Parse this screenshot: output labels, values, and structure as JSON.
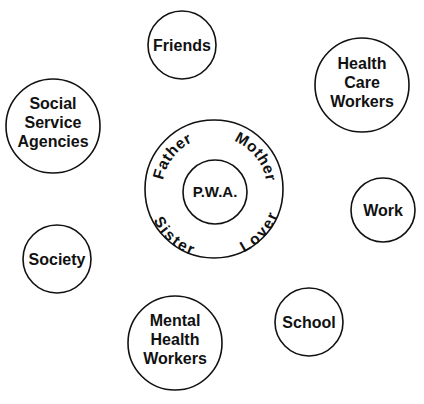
{
  "diagram": {
    "center": {
      "label": "P.W.A.",
      "ring": [
        "Father",
        "Mother",
        "Sister",
        "Lover"
      ]
    },
    "nodes": [
      {
        "id": "friends",
        "lines": [
          "Friends"
        ]
      },
      {
        "id": "health-care-workers",
        "lines": [
          "Health",
          "Care",
          "Workers"
        ]
      },
      {
        "id": "social-service-agencies",
        "lines": [
          "Social",
          "Service",
          "Agencies"
        ]
      },
      {
        "id": "work",
        "lines": [
          "Work"
        ]
      },
      {
        "id": "society",
        "lines": [
          "Society"
        ]
      },
      {
        "id": "school",
        "lines": [
          "School"
        ]
      },
      {
        "id": "mental-health-workers",
        "lines": [
          "Mental",
          "Health",
          "Workers"
        ]
      }
    ]
  }
}
